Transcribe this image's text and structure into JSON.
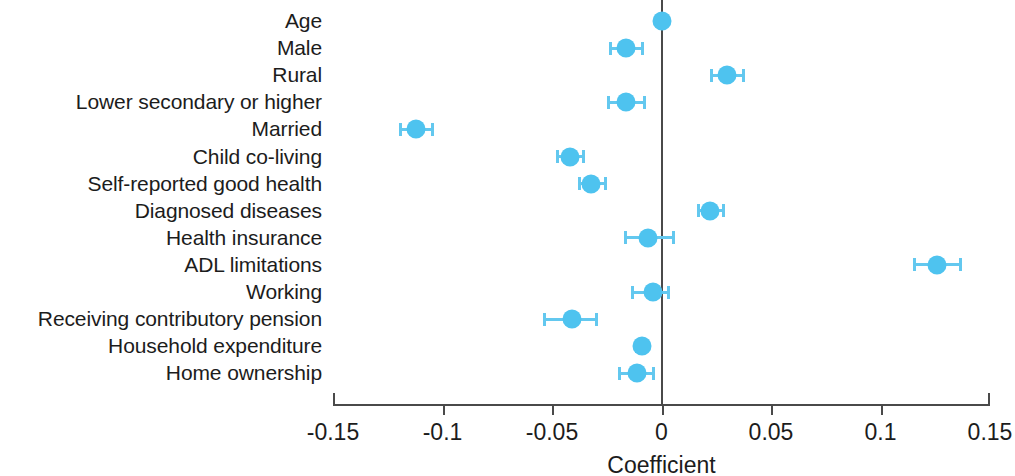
{
  "chart_data": {
    "type": "scatter",
    "subtype": "forest-plot",
    "title": "",
    "xlabel": "Coefficient",
    "ylabel": "",
    "xlim": [
      -0.15,
      0.15
    ],
    "xticks": [
      -0.15,
      -0.1,
      -0.05,
      0,
      0.05,
      0.1,
      0.15
    ],
    "xticklabels": [
      "-0.15",
      "-0.1",
      "-0.05",
      "0",
      "0.05",
      "0.1",
      "0.15"
    ],
    "grid": false,
    "legend": null,
    "reference_line": 0,
    "marker_color": "#4ec3ef",
    "errorbar_color": "#63c8ef",
    "axis_color": "#4a4a4a",
    "categories": [
      "Age",
      "Male",
      "Rural",
      "Lower secondary or higher",
      "Married",
      "Child co-living",
      "Self-reported good health",
      "Diagnosed diseases",
      "Health insurance",
      "ADL limitations",
      "Working",
      "Receiving contributory pension",
      "Household expenditure",
      "Home ownership"
    ],
    "values": [
      0.0,
      -0.016,
      0.03,
      -0.016,
      -0.112,
      -0.042,
      -0.032,
      0.022,
      -0.006,
      0.126,
      -0.004,
      -0.041,
      -0.009,
      -0.011
    ],
    "ci_low": [
      -0.002,
      -0.024,
      0.022,
      -0.025,
      -0.12,
      -0.048,
      -0.038,
      0.016,
      -0.017,
      0.115,
      -0.014,
      -0.054,
      -0.012,
      -0.02
    ],
    "ci_high": [
      0.002,
      -0.008,
      0.038,
      -0.007,
      -0.104,
      -0.035,
      -0.025,
      0.029,
      0.006,
      0.137,
      0.004,
      -0.029,
      -0.006,
      -0.003
    ],
    "points": [
      {
        "label": "Age",
        "value": 0.0,
        "ci_low": -0.002,
        "ci_high": 0.002
      },
      {
        "label": "Male",
        "value": -0.016,
        "ci_low": -0.024,
        "ci_high": -0.008
      },
      {
        "label": "Rural",
        "value": 0.03,
        "ci_low": 0.022,
        "ci_high": 0.038
      },
      {
        "label": "Lower secondary or higher",
        "value": -0.016,
        "ci_low": -0.025,
        "ci_high": -0.007
      },
      {
        "label": "Married",
        "value": -0.112,
        "ci_low": -0.12,
        "ci_high": -0.104
      },
      {
        "label": "Child co-living",
        "value": -0.042,
        "ci_low": -0.048,
        "ci_high": -0.035
      },
      {
        "label": "Self-reported good health",
        "value": -0.032,
        "ci_low": -0.038,
        "ci_high": -0.025
      },
      {
        "label": "Diagnosed diseases",
        "value": 0.022,
        "ci_low": 0.016,
        "ci_high": 0.029
      },
      {
        "label": "Health insurance",
        "value": -0.006,
        "ci_low": -0.017,
        "ci_high": 0.006
      },
      {
        "label": "ADL limitations",
        "value": 0.126,
        "ci_low": 0.115,
        "ci_high": 0.137
      },
      {
        "label": "Working",
        "value": -0.004,
        "ci_low": -0.014,
        "ci_high": 0.004
      },
      {
        "label": "Receiving contributory pension",
        "value": -0.041,
        "ci_low": -0.054,
        "ci_high": -0.029
      },
      {
        "label": "Household expenditure",
        "value": -0.009,
        "ci_low": -0.012,
        "ci_high": -0.006
      },
      {
        "label": "Home ownership",
        "value": -0.011,
        "ci_low": -0.02,
        "ci_high": -0.003
      }
    ]
  }
}
